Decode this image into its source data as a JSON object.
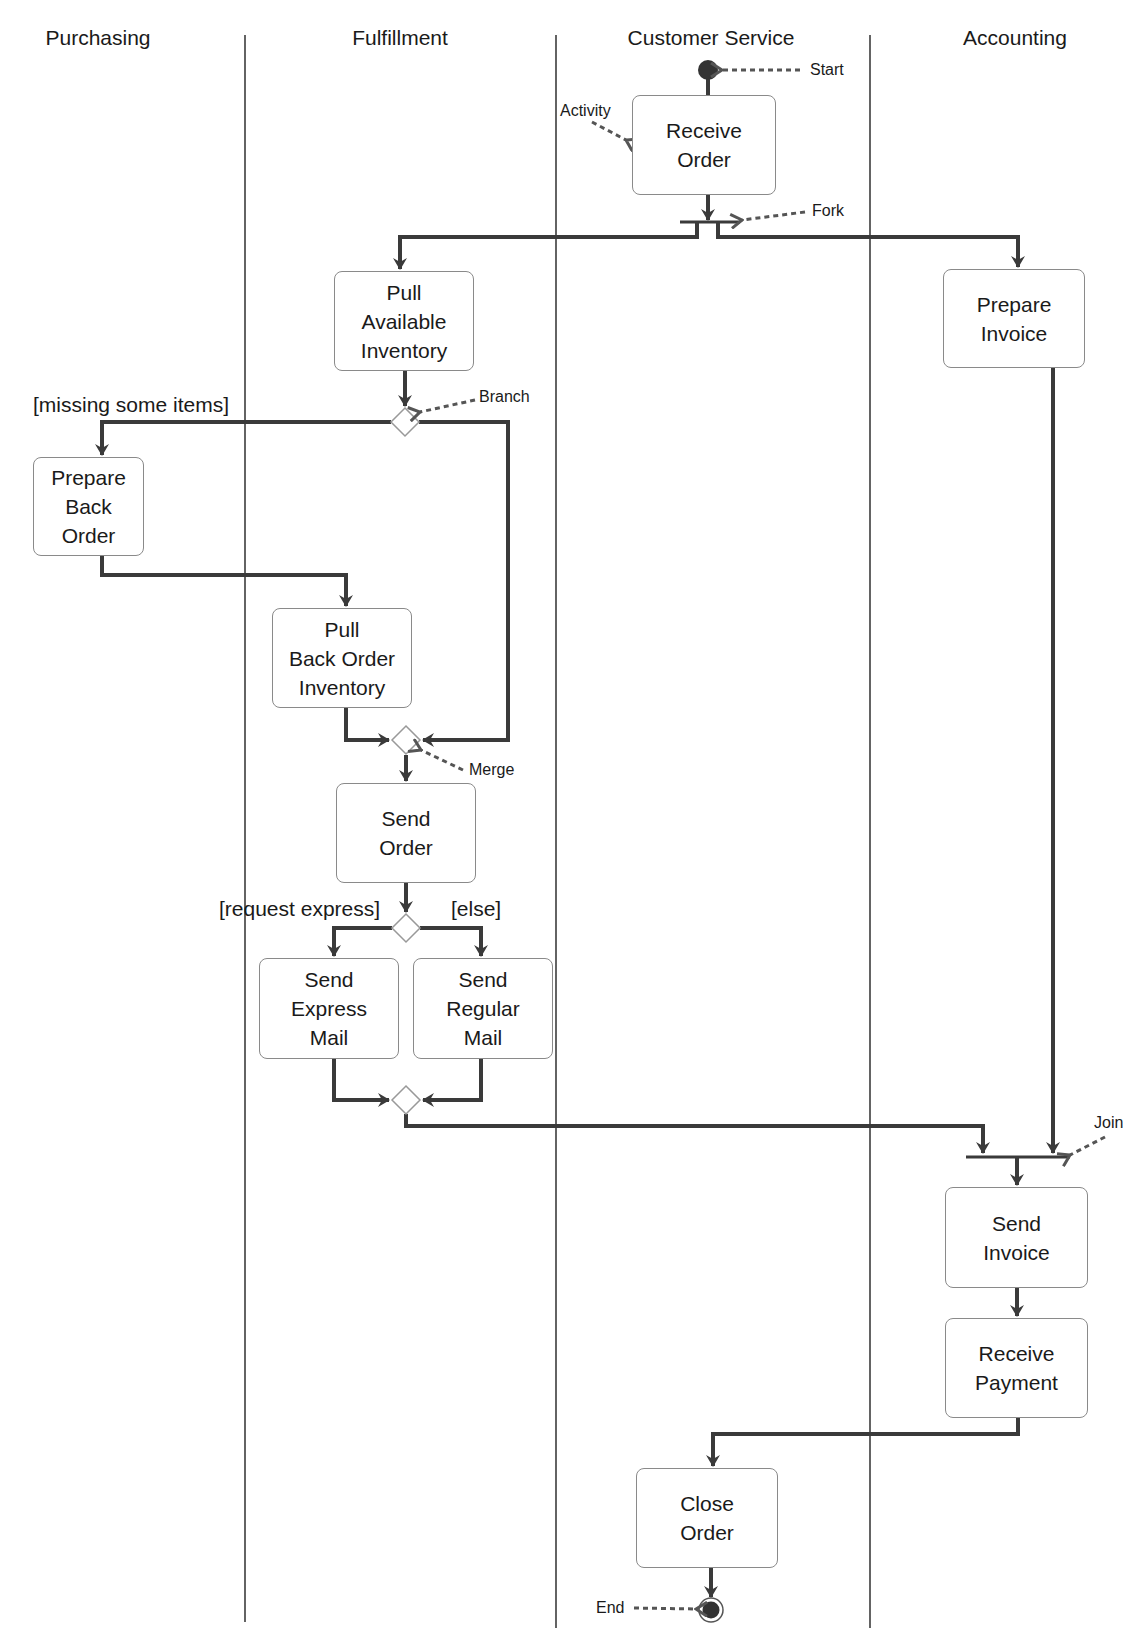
{
  "diagram": {
    "type": "uml-activity-swimlane",
    "lanes": [
      {
        "id": "purchasing",
        "label": "Purchasing"
      },
      {
        "id": "fulfillment",
        "label": "Fulfillment"
      },
      {
        "id": "customer_service",
        "label": "Customer Service"
      },
      {
        "id": "accounting",
        "label": "Accounting"
      }
    ],
    "activities": {
      "receive_order": {
        "label": "Receive\nOrder",
        "lane": "customer_service"
      },
      "pull_available_inventory": {
        "label": "Pull\nAvailable\nInventory",
        "lane": "fulfillment"
      },
      "prepare_invoice": {
        "label": "Prepare\nInvoice",
        "lane": "accounting"
      },
      "prepare_back_order": {
        "label": "Prepare\nBack\nOrder",
        "lane": "purchasing"
      },
      "pull_back_order_inventory": {
        "label": "Pull\nBack Order\nInventory",
        "lane": "fulfillment"
      },
      "send_order": {
        "label": "Send\nOrder",
        "lane": "fulfillment"
      },
      "send_express_mail": {
        "label": "Send\nExpress\nMail",
        "lane": "fulfillment"
      },
      "send_regular_mail": {
        "label": "Send\nRegular\nMail",
        "lane": "fulfillment"
      },
      "send_invoice": {
        "label": "Send\nInvoice",
        "lane": "accounting"
      },
      "receive_payment": {
        "label": "Receive\nPayment",
        "lane": "accounting"
      },
      "close_order": {
        "label": "Close\nOrder",
        "lane": "customer_service"
      }
    },
    "guards": {
      "missing_items": "[missing some items]",
      "request_express": "[request express]",
      "else": "[else]"
    },
    "annotations": {
      "start": "Start",
      "activity": "Activity",
      "fork": "Fork",
      "branch": "Branch",
      "merge": "Merge",
      "join": "Join",
      "end": "End"
    },
    "flows": [
      [
        "start",
        "receive_order"
      ],
      [
        "receive_order",
        "fork"
      ],
      [
        "fork",
        "pull_available_inventory"
      ],
      [
        "fork",
        "prepare_invoice"
      ],
      [
        "pull_available_inventory",
        "branch"
      ],
      [
        "branch",
        "prepare_back_order",
        "[missing some items]"
      ],
      [
        "branch",
        "merge"
      ],
      [
        "prepare_back_order",
        "pull_back_order_inventory"
      ],
      [
        "pull_back_order_inventory",
        "merge"
      ],
      [
        "merge",
        "send_order"
      ],
      [
        "send_order",
        "decision"
      ],
      [
        "decision",
        "send_express_mail",
        "[request express]"
      ],
      [
        "decision",
        "send_regular_mail",
        "[else]"
      ],
      [
        "send_express_mail",
        "merge2"
      ],
      [
        "send_regular_mail",
        "merge2"
      ],
      [
        "merge2",
        "join"
      ],
      [
        "prepare_invoice",
        "join"
      ],
      [
        "join",
        "send_invoice"
      ],
      [
        "send_invoice",
        "receive_payment"
      ],
      [
        "receive_payment",
        "close_order"
      ],
      [
        "close_order",
        "end"
      ]
    ],
    "colors": {
      "flow_line": "#3a3a3a",
      "node_border": "#8a8a8a",
      "lane_divider": "#222222",
      "annotation_arrow": "#555555"
    }
  }
}
